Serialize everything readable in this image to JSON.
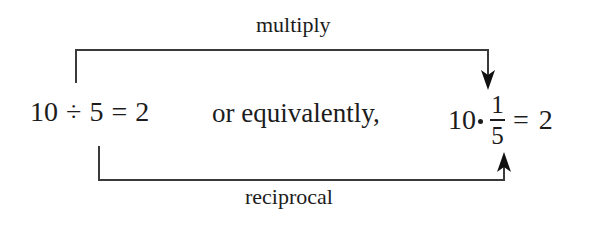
{
  "diagram": {
    "left_expression": {
      "dividend": "10",
      "operator": "÷",
      "divisor": "5",
      "equals": "=",
      "result": "2"
    },
    "connector_text": "or equivalently,",
    "right_expression": {
      "factor": "10",
      "operator": "·",
      "fraction": {
        "numerator": "1",
        "denominator": "5"
      },
      "equals": "=",
      "result": "2"
    },
    "arrows": {
      "top": {
        "label": "multiply",
        "from": "10 (dividend)",
        "to": "fraction numerator"
      },
      "bottom": {
        "label": "reciprocal",
        "from": "5 (divisor)",
        "to": "fraction denominator"
      }
    },
    "colors": {
      "ink": "#1c1c1c",
      "line": "#3a3a3a",
      "background": "#ffffff"
    }
  }
}
